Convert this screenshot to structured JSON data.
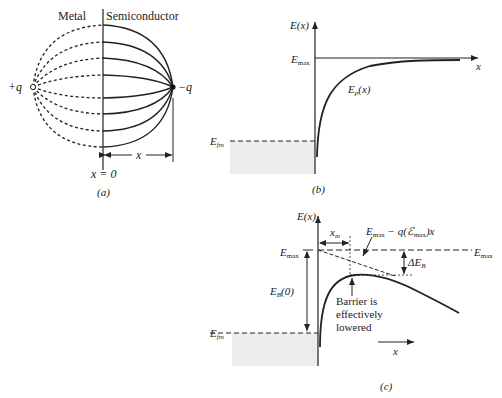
{
  "panel_a": {
    "caption": "(a)",
    "metal_label": "Metal",
    "semiconductor_label": "Semiconductor",
    "positive_charge": "+q",
    "negative_charge": "−q",
    "origin_label": "x = 0",
    "distance_label": "x"
  },
  "panel_b": {
    "caption": "(b)",
    "y_axis": "E(x)",
    "x_axis": "x",
    "emax": "E",
    "emax_sub": "max",
    "efm": "E",
    "efm_sub": "fm",
    "curve": "E",
    "curve_sub": "p",
    "curve_arg": "(x)"
  },
  "panel_c": {
    "caption": "(c)",
    "y_axis": "E(x)",
    "x_axis": "x",
    "emax_left": "E",
    "emax_right": "E",
    "emax_sub": "max",
    "xm": "x",
    "xm_sub": "m",
    "tangent_a": "E",
    "tangent_b": " − q(ℰ",
    "tangent_c": ")x",
    "delta_eb": "ΔE",
    "delta_eb_sub": "B",
    "eb0": "E",
    "eb0_sub": "B",
    "eb0_arg": "(0)",
    "efm": "E",
    "efm_sub": "fm",
    "note_line1": "Barrier is",
    "note_line2": "effectively",
    "note_line3": "lowered"
  }
}
